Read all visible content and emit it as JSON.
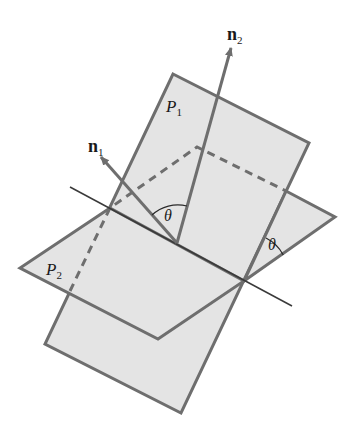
{
  "figure": {
    "colors": {
      "plane_fill": "#e4e4e4",
      "plane_edge": "#6e6e6e",
      "line": "#3a3a3a",
      "arc": "#2a2a2a",
      "text": "#1a1a1a"
    },
    "labels": {
      "plane1": {
        "base": "P",
        "sub": "1"
      },
      "plane2": {
        "base": "P",
        "sub": "2"
      },
      "normal1": {
        "base": "n",
        "sub": "1"
      },
      "normal2": {
        "base": "n",
        "sub": "2"
      },
      "angle_between_normals": "θ",
      "angle_between_planes": "θ"
    }
  }
}
